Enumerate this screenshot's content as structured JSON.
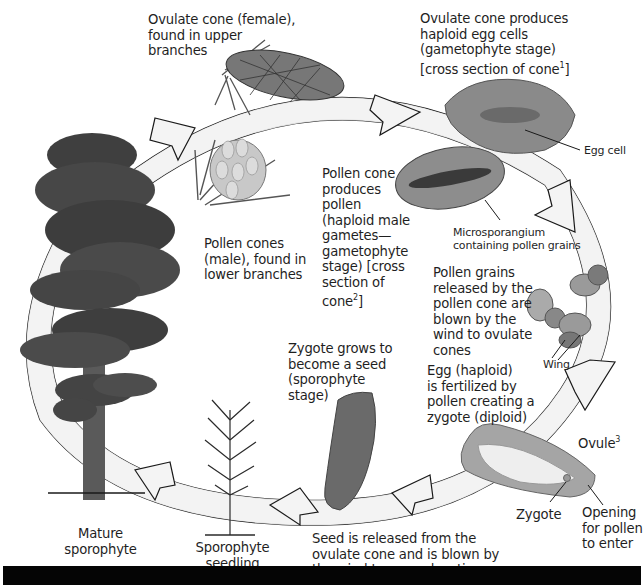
{
  "diagram": {
    "cycle_direction": "clockwise",
    "colors": {
      "arrow_fill": "#f2f2f2",
      "arrow_stroke": "#1a1a1a",
      "foliage": "#4a4a4a",
      "trunk": "#5a5a5a",
      "bottom_bar": "#050505"
    },
    "labels": {
      "ovulate_cone": "Ovulate cone (female),\nfound in upper\nbranches",
      "egg_cells": "Ovulate cone produces\nhaploid egg cells\n(gametophyte stage)\n[cross section of cone",
      "egg_cells_sup": "1",
      "egg_cells_end": "]",
      "egg_cell": "Egg cell",
      "pollen_cones": "Pollen cones\n(male), found in\nlower branches",
      "pollen_produce": "Pollen cone\nproduces\npollen\n(haploid male\ngametes—\ngametophyte\nstage) [cross\nsection of\ncone",
      "pollen_produce_sup": "2",
      "pollen_produce_end": "]",
      "microsporangium": "Microsporangium\ncontaining pollen grains",
      "pollen_grains": "Pollen grains\nreleased by the\npollen cone are\nblown by the\nwind to ovulate\ncones",
      "wing": "Wing",
      "fertilized": "Egg (haploid)\nis fertilized by\npollen creating a\nzygote (diploid)",
      "ovule": "Ovule",
      "ovule_sup": "3",
      "zygote": "Zygote",
      "opening": "Opening\nfor pollen\nto enter",
      "zygote_grows": "Zygote grows to\nbecome a seed\n(sporophyte\nstage)",
      "seed_released": "Seed is released from the\novulate cone and is blown by\nthe wind to a new location",
      "seedling": "Sporophyte\nseedling",
      "mature": "Mature\nsporophyte"
    }
  }
}
